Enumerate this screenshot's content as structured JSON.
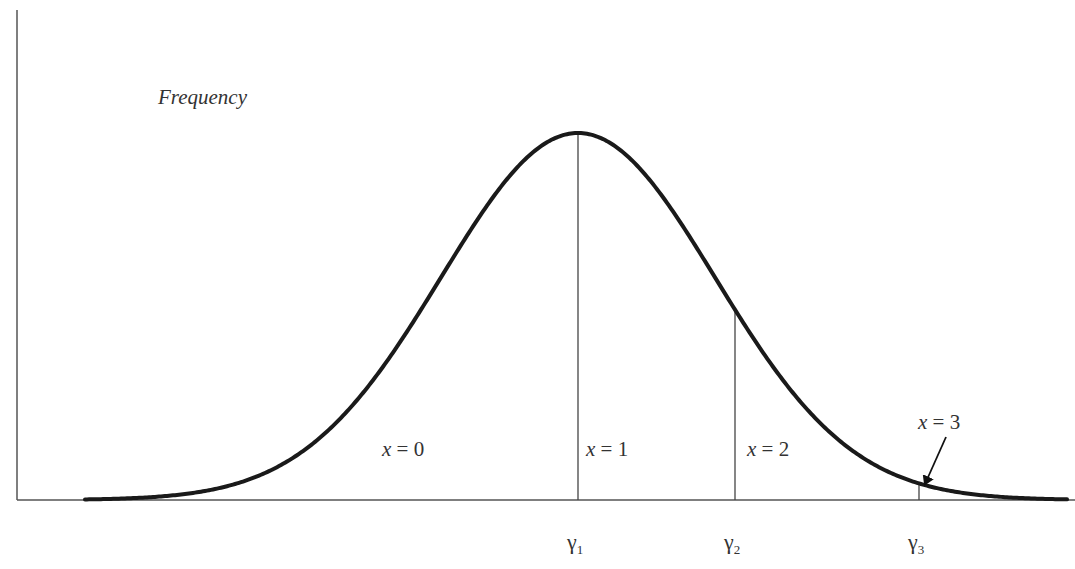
{
  "chart_data": {
    "type": "line",
    "title": "",
    "ylabel": "Frequency",
    "xlabel": "",
    "grid": false,
    "legend": null,
    "curve": {
      "shape": "normal-distribution",
      "peak_x_px": 578,
      "sigma_px": 137,
      "baseline_y_px": 500,
      "peak_y_px": 133,
      "start_x_px": 85,
      "end_x_px": 1068,
      "stroke": "#1a1a1a"
    },
    "thresholds": [
      {
        "label": "γ1",
        "base": "γ",
        "sub": "1",
        "x_px": 578
      },
      {
        "label": "γ2",
        "base": "γ",
        "sub": "2",
        "x_px": 735
      },
      {
        "label": "γ3",
        "base": "γ",
        "sub": "3",
        "x_px": 919
      }
    ],
    "regions": [
      {
        "label": "x = 0",
        "var": "x",
        "value": "0",
        "x_px": 382,
        "y_px": 456
      },
      {
        "label": "x = 1",
        "var": "x",
        "value": "1",
        "x_px": 586,
        "y_px": 456
      },
      {
        "label": "x = 2",
        "var": "x",
        "value": "2",
        "x_px": 747,
        "y_px": 456
      },
      {
        "label": "x = 3",
        "var": "x",
        "value": "3",
        "x_px": 918,
        "y_px": 429,
        "arrow": {
          "from": [
            946,
            437
          ],
          "to": [
            925,
            484
          ]
        }
      }
    ],
    "axes": {
      "y_axis_x_px": 17,
      "y_axis_top_px": 10,
      "x_axis_y_px": 500,
      "x_axis_right_px": 1075
    }
  },
  "labels": {
    "y_axis": "Frequency"
  }
}
